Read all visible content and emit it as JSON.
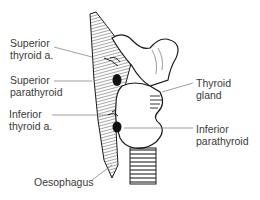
{
  "diagram": {
    "labels": [
      {
        "id": "superior-thyroid-artery",
        "line1": "Superior",
        "line2": "thyroid a."
      },
      {
        "id": "superior-parathyroid",
        "line1": "Superior",
        "line2": "parathyroid"
      },
      {
        "id": "thyroid-gland",
        "line1": "Thyroid",
        "line2": "gland"
      },
      {
        "id": "inferior-thyroid-artery",
        "line1": "Inferior",
        "line2": "thyroid a."
      },
      {
        "id": "inferior-parathyroid",
        "line1": "Inferior",
        "line2": "parathyroid"
      },
      {
        "id": "oesophagus",
        "line1": "Oesophagus"
      }
    ],
    "colors": {
      "ink": "#1a1a1a",
      "label_text": "#3a3a3a",
      "leader_line": "#777777",
      "background": "#ffffff"
    }
  }
}
